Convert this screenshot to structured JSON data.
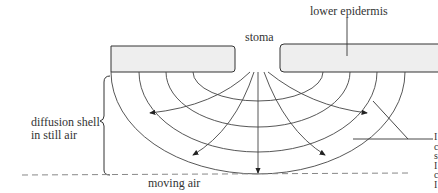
{
  "labels": {
    "stoma": "stoma",
    "lower_epidermis": "lower epidermis",
    "diffusion_shell_line1": "diffusion shell",
    "diffusion_shell_line2": "in still air",
    "moving_air": "moving air"
  },
  "cut_off_right_label": [
    "I",
    "c",
    "s",
    "I",
    "c",
    "I"
  ],
  "colors": {
    "stroke": "#333333",
    "epidermis_fill": "#eeeeee",
    "dashed": "#888888"
  }
}
